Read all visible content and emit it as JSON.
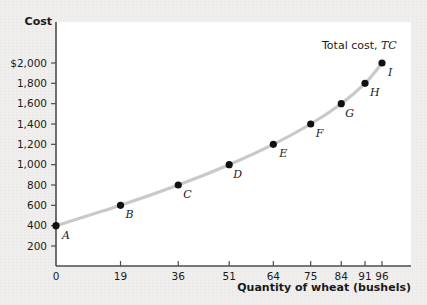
{
  "chart_data": {
    "type": "line",
    "title": "",
    "xlabel": "Quantity of wheat (bushels)",
    "ylabel": "Cost",
    "series_label_main": "Total cost,",
    "series_label_symbol": "TC",
    "x": [
      0,
      19,
      36,
      51,
      64,
      75,
      84,
      91,
      96
    ],
    "values": [
      400,
      600,
      800,
      1000,
      1200,
      1400,
      1600,
      1800,
      2000
    ],
    "point_labels": [
      "A",
      "B",
      "C",
      "D",
      "E",
      "F",
      "G",
      "H",
      "I"
    ],
    "xtick_labels": [
      "0",
      "19",
      "36",
      "51",
      "64",
      "75",
      "84",
      "91",
      "96"
    ],
    "ytick_labels": [
      "200",
      "400",
      "600",
      "800",
      "1,000",
      "1,200",
      "1,400",
      "1,600",
      "1,800",
      "$2,000"
    ],
    "ytick_values": [
      200,
      400,
      600,
      800,
      1000,
      1200,
      1400,
      1600,
      1800,
      2000
    ],
    "xlim": [
      0,
      96
    ],
    "ylim": [
      0,
      2000
    ],
    "grid": false,
    "legend_position": "inside-top-right",
    "colors": {
      "curve": "#c9c9c9",
      "point": "#111111",
      "axis": "#4d4d4d",
      "plot_background": "#ffffff",
      "page_background": "#f0efee",
      "text": "#1a1a1a"
    }
  }
}
